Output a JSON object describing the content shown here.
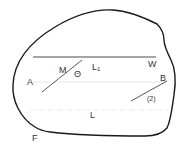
{
  "diagram": {
    "labels": {
      "A": "A",
      "M": "M",
      "theta": "Θ",
      "L1_main": "L",
      "L1_sub": "1",
      "W": "W",
      "B": "B",
      "line2": "(2)",
      "L": "L",
      "F": "F"
    },
    "colors": {
      "outline": "#1a1a1a",
      "top_line": "#888888",
      "faint_line": "#e6e6e6",
      "segment": "#444444",
      "text": "#333333"
    }
  }
}
